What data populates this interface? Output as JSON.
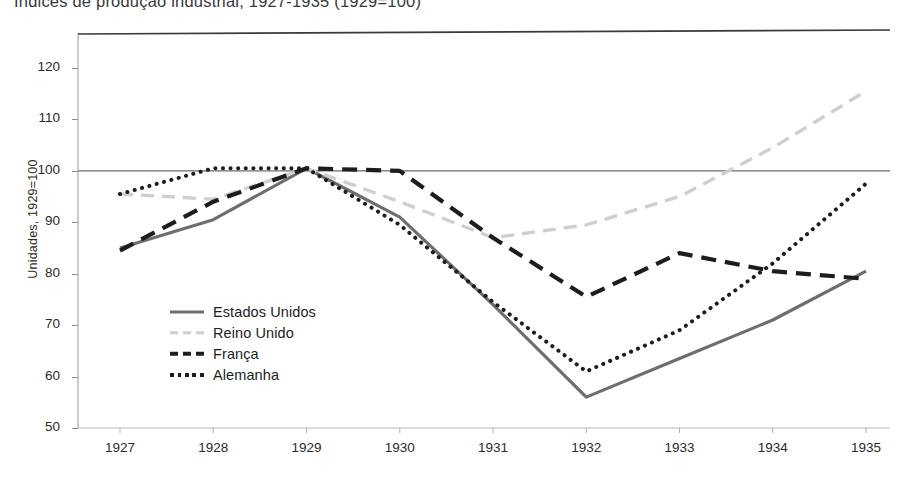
{
  "chart_data": {
    "type": "line",
    "title": "Índices de produção industrial, 1927-1935 (1929=100)",
    "xlabel": "",
    "ylabel": "Unidades, 1929=100",
    "x": [
      1927,
      1928,
      1929,
      1930,
      1931,
      1932,
      1933,
      1934,
      1935
    ],
    "categories": [
      "1927",
      "1928",
      "1929",
      "1930",
      "1931",
      "1932",
      "1933",
      "1934",
      "1935"
    ],
    "xticklabels": [
      "1927",
      "1928",
      "1929",
      "1930",
      "1931",
      "1932",
      "1933",
      "1934",
      "1935"
    ],
    "yticklabels": [
      "50",
      "60",
      "70",
      "80",
      "90",
      "100",
      "110",
      "120"
    ],
    "ytickvalues": [
      50,
      60,
      70,
      80,
      90,
      100,
      110,
      120
    ],
    "ylim": [
      50,
      125
    ],
    "xlim": [
      1927,
      1935
    ],
    "grid": false,
    "reference_line": 100,
    "legend_position": "center-left-inside",
    "series": [
      {
        "name": "Estados Unidos",
        "style": "solid",
        "color": "#6e6e6e",
        "values": [
          85.0,
          90.5,
          100.5,
          91.0,
          74.0,
          56.0,
          63.5,
          71.0,
          80.5
        ]
      },
      {
        "name": "Reino Unido",
        "style": "dashed",
        "color": "#cfcfcf",
        "values": [
          95.5,
          94.5,
          100.5,
          94.0,
          87.0,
          89.5,
          95.0,
          104.5,
          115.5
        ]
      },
      {
        "name": "França",
        "style": "dashed-bold",
        "color": "#1d1d1d",
        "values": [
          84.5,
          94.0,
          100.5,
          100.0,
          87.0,
          75.5,
          84.0,
          80.5,
          79.0
        ]
      },
      {
        "name": "Alemanha",
        "style": "dotted",
        "color": "#1d1d1d",
        "values": [
          95.5,
          100.5,
          100.5,
          89.5,
          74.5,
          61.0,
          69.0,
          82.0,
          97.5
        ]
      }
    ]
  },
  "axis": {
    "y_title": "Unidades, 1929=100"
  }
}
